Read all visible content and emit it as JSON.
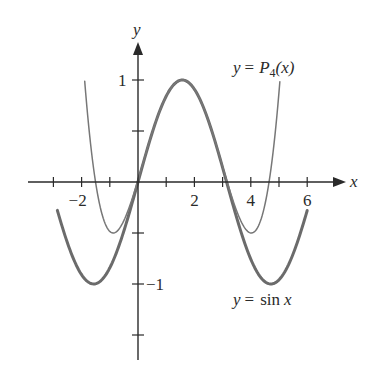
{
  "chart_data": {
    "type": "line",
    "title": "",
    "xlabel": "x",
    "ylabel": "y",
    "x_ticks": [
      -3,
      -2,
      -1,
      0,
      1,
      2,
      3,
      4,
      5,
      6
    ],
    "x_tick_labels": [
      {
        "value": -2,
        "text": "−2"
      },
      {
        "value": 2,
        "text": "2"
      },
      {
        "value": 4,
        "text": "4"
      },
      {
        "value": 6,
        "text": "6"
      }
    ],
    "y_ticks": [
      -1.5,
      -1,
      -0.5,
      0,
      0.5,
      1
    ],
    "y_tick_labels": [
      {
        "value": 1,
        "text": "1"
      },
      {
        "value": -1,
        "text": "−1"
      }
    ],
    "xlim": [
      -3.1,
      7.3
    ],
    "ylim": [
      -1.75,
      1.35
    ],
    "grid": false,
    "series": [
      {
        "name": "y = sin x",
        "formula": "sin(x)",
        "x_range": [
          -2.86,
          6.0
        ],
        "color": "#6b6b6b",
        "width": 3,
        "label": {
          "prefix": "y =",
          "text": "sin",
          "var": "x"
        },
        "points": [
          [
            -2.86,
            -0.28
          ],
          [
            -2.5,
            -0.6
          ],
          [
            -2,
            -0.91
          ],
          [
            -1.57,
            -1.0
          ],
          [
            -1,
            -0.84
          ],
          [
            -0.5,
            -0.48
          ],
          [
            0,
            0
          ],
          [
            0.5,
            0.48
          ],
          [
            1,
            0.84
          ],
          [
            1.57,
            1.0
          ],
          [
            2,
            0.91
          ],
          [
            2.5,
            0.6
          ],
          [
            3,
            0.14
          ],
          [
            3.14,
            0
          ],
          [
            3.5,
            -0.35
          ],
          [
            4,
            -0.76
          ],
          [
            4.71,
            -1.0
          ],
          [
            5,
            -0.96
          ],
          [
            5.5,
            -0.71
          ],
          [
            6,
            -0.28
          ]
        ]
      },
      {
        "name": "y = P4(x)",
        "formula": "1 - (x - pi/2)^2/2 + (x - pi/2)^4/24",
        "x_range": [
          -1.89,
          5.03
        ],
        "color": "#777777",
        "width": 1.5,
        "label": {
          "prefix": "y =",
          "func": "P",
          "sub": "4",
          "arg": "(x)"
        },
        "points": [
          [
            -1.89,
            1.0
          ],
          [
            -1.5,
            0.0
          ],
          [
            -1.0,
            -0.42
          ],
          [
            -0.88,
            -0.5
          ],
          [
            -0.5,
            -0.37
          ],
          [
            0,
            0.02
          ],
          [
            0.5,
            0.56
          ],
          [
            1,
            0.84
          ],
          [
            1.57,
            1.0
          ],
          [
            2,
            0.91
          ],
          [
            2.5,
            0.57
          ],
          [
            3,
            0.02
          ],
          [
            3.5,
            -0.38
          ],
          [
            4.02,
            -0.5
          ],
          [
            4.5,
            -0.17
          ],
          [
            5.03,
            1.0
          ]
        ]
      }
    ],
    "legend": "inline labels",
    "annotations": [
      {
        "text": "y = P4(x)",
        "near": "upper right"
      },
      {
        "text": "y = sin x",
        "near": "lower right"
      }
    ]
  },
  "colors": {
    "axis": "#2a2a2a",
    "sin_curve": "#6b6b6b",
    "p4_curve": "#777777",
    "background": "#ffffff"
  }
}
